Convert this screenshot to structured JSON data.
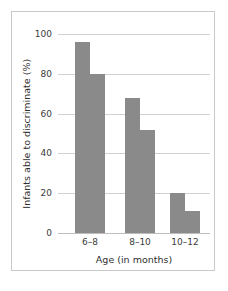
{
  "chart_data": {
    "type": "bar",
    "title": "",
    "xlabel": "Age (in months)",
    "ylabel": "Infants able to discriminate (%)",
    "categories": [
      "6–8",
      "8–10",
      "10–12"
    ],
    "series": [
      {
        "name": "first bar",
        "values": [
          96,
          68,
          20
        ]
      },
      {
        "name": "second bar",
        "values": [
          80,
          52,
          11
        ]
      }
    ],
    "values_flat": [
      96,
      80,
      68,
      52,
      20,
      11
    ],
    "ylim": [
      0,
      100
    ],
    "yticks": [
      0,
      20,
      40,
      60,
      80,
      100
    ],
    "ytick_labels": [
      "0",
      "20",
      "40",
      "60",
      "80",
      "100"
    ],
    "grid": true,
    "legend": "none",
    "bar_color": "#8a8a8a",
    "gridline_color": "#d2d2d2",
    "frame_color": "#c9c9c9",
    "background_color": "#ffffff"
  },
  "ticks": {
    "y": [
      {
        "label": "100",
        "value": 100
      },
      {
        "label": "80",
        "value": 80
      },
      {
        "label": "60",
        "value": 60
      },
      {
        "label": "40",
        "value": 40
      },
      {
        "label": "20",
        "value": 20
      },
      {
        "label": "0",
        "value": 0
      }
    ]
  },
  "groups": [
    {
      "label": "6–8",
      "bars": [
        96,
        80
      ]
    },
    {
      "label": "8–10",
      "bars": [
        68,
        52
      ]
    },
    {
      "label": "10–12",
      "bars": [
        20,
        11
      ]
    }
  ],
  "axis_titles": {
    "x": "Age (in months)",
    "y": "Infants able to discriminate (%)"
  }
}
